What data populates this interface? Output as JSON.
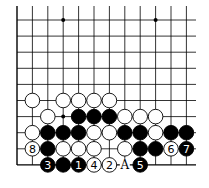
{
  "diagram": {
    "type": "go-board-fragment",
    "columns": 12,
    "rows": 10,
    "star_points": [
      [
        3,
        0
      ],
      [
        9,
        0
      ],
      [
        3,
        6
      ]
    ],
    "stones": [
      {
        "c": 1,
        "r": 5,
        "color": "white"
      },
      {
        "c": 3,
        "r": 5,
        "color": "white"
      },
      {
        "c": 4,
        "r": 5,
        "color": "white"
      },
      {
        "c": 5,
        "r": 5,
        "color": "white"
      },
      {
        "c": 6,
        "r": 5,
        "color": "white"
      },
      {
        "c": 2,
        "r": 6,
        "color": "white"
      },
      {
        "c": 4,
        "r": 6,
        "color": "black"
      },
      {
        "c": 5,
        "r": 6,
        "color": "black"
      },
      {
        "c": 6,
        "r": 6,
        "color": "black"
      },
      {
        "c": 7,
        "r": 6,
        "color": "white"
      },
      {
        "c": 8,
        "r": 6,
        "color": "white"
      },
      {
        "c": 9,
        "r": 6,
        "color": "white"
      },
      {
        "c": 1,
        "r": 7,
        "color": "white"
      },
      {
        "c": 2,
        "r": 7,
        "color": "black"
      },
      {
        "c": 3,
        "r": 7,
        "color": "black"
      },
      {
        "c": 4,
        "r": 7,
        "color": "black"
      },
      {
        "c": 5,
        "r": 7,
        "color": "white"
      },
      {
        "c": 6,
        "r": 7,
        "color": "white"
      },
      {
        "c": 7,
        "r": 7,
        "color": "black"
      },
      {
        "c": 8,
        "r": 7,
        "color": "black"
      },
      {
        "c": 9,
        "r": 7,
        "color": "white"
      },
      {
        "c": 10,
        "r": 7,
        "color": "black"
      },
      {
        "c": 11,
        "r": 7,
        "color": "black"
      },
      {
        "c": 1,
        "r": 8,
        "color": "white",
        "label": "8"
      },
      {
        "c": 2,
        "r": 8,
        "color": "black"
      },
      {
        "c": 3,
        "r": 8,
        "color": "white"
      },
      {
        "c": 4,
        "r": 8,
        "color": "white"
      },
      {
        "c": 5,
        "r": 8,
        "color": "white"
      },
      {
        "c": 7,
        "r": 8,
        "color": "white"
      },
      {
        "c": 8,
        "r": 8,
        "color": "black"
      },
      {
        "c": 9,
        "r": 8,
        "color": "black"
      },
      {
        "c": 10,
        "r": 8,
        "color": "white",
        "label": "6"
      },
      {
        "c": 11,
        "r": 8,
        "color": "black",
        "label": "7"
      },
      {
        "c": 2,
        "r": 9,
        "color": "black",
        "label": "3"
      },
      {
        "c": 3,
        "r": 9,
        "color": "black"
      },
      {
        "c": 4,
        "r": 9,
        "color": "black",
        "label": "1"
      },
      {
        "c": 5,
        "r": 9,
        "color": "white",
        "label": "4"
      },
      {
        "c": 6,
        "r": 9,
        "color": "white",
        "label": "2"
      },
      {
        "c": 8,
        "r": 9,
        "color": "black",
        "label": "5"
      }
    ],
    "markers": [
      {
        "c": 7,
        "r": 9,
        "label": "A"
      }
    ]
  }
}
